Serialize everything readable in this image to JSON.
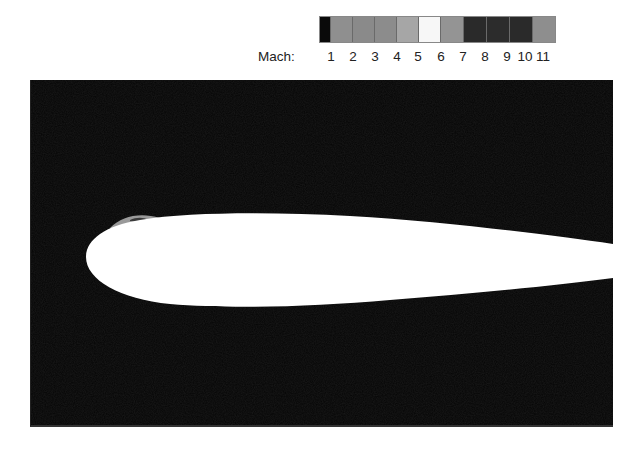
{
  "legend": {
    "title": "Mach:",
    "ticks": [
      "1",
      "2",
      "3",
      "4",
      "5",
      "6",
      "7",
      "8",
      "9",
      "10",
      "11"
    ],
    "tick_positions": [
      73,
      95,
      117,
      139,
      160,
      183,
      205,
      227,
      249,
      267,
      285
    ],
    "segments": [
      {
        "color": "#0a0a0a",
        "width": 11
      },
      {
        "color": "#8f8f8f",
        "width": 22
      },
      {
        "color": "#8a8a8a",
        "width": 22
      },
      {
        "color": "#8c8c8c",
        "width": 22
      },
      {
        "color": "#a6a6a6",
        "width": 22
      },
      {
        "color": "#f7f7f7",
        "width": 22
      },
      {
        "color": "#949494",
        "width": 23
      },
      {
        "color": "#2a2a2a",
        "width": 23
      },
      {
        "color": "#2c2c2c",
        "width": 23
      },
      {
        "color": "#2a2a2a",
        "width": 23
      },
      {
        "color": "#8e8e8e",
        "width": 22
      }
    ]
  },
  "plot": {
    "background": "#050505",
    "airfoil_color": "#ffffff",
    "shock_color": "#9a9a9a",
    "description": "Airfoil cross-section in flow field (Mach contour)"
  }
}
